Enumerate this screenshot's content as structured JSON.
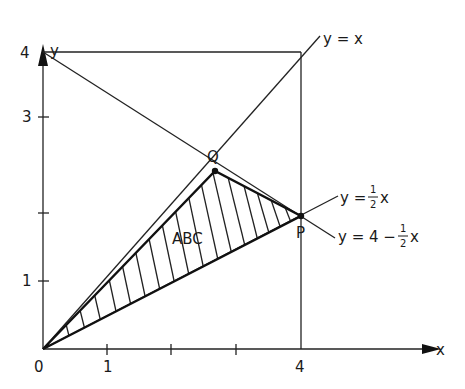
{
  "diagram": {
    "axes": {
      "x_label": "x",
      "y_label": "y",
      "origin_label": "0",
      "x_ticks": [
        {
          "value": 1,
          "label": "1"
        },
        {
          "value": 2,
          "label": ""
        },
        {
          "value": 3,
          "label": ""
        },
        {
          "value": 4,
          "label": "4"
        }
      ],
      "y_ticks": [
        {
          "value": 1,
          "label": "1"
        },
        {
          "value": 2,
          "label": ""
        },
        {
          "value": 3,
          "label": "3"
        },
        {
          "value": 4,
          "label": "4"
        }
      ]
    },
    "lines": {
      "identity": "y = x",
      "half": "y = ½x",
      "half_prefix": "y =",
      "half_num": "1",
      "half_den": "2",
      "half_var": "x",
      "descending_prefix": "y = 4 −",
      "descending_num": "1",
      "descending_den": "2",
      "descending_var": "x"
    },
    "points": {
      "Q": "Q",
      "P": "P"
    },
    "region_label": "ABC",
    "colors": {
      "ink": "#1a1a1a",
      "background": "#ffffff"
    }
  }
}
